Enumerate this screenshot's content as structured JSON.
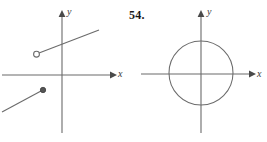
{
  "figure": {
    "exercise_number": "54.",
    "width": 267,
    "height": 142,
    "background_color": "#ffffff",
    "stroke_color": "#6b6b6b",
    "text_color": "#3a3a3a"
  },
  "left_graph": {
    "name": "piecewise-linear-graph",
    "origin": {
      "x": 62,
      "y": 75
    },
    "x_axis": {
      "label": "x",
      "start_x": 2,
      "end_x": 116,
      "y": 75,
      "arrow": "right"
    },
    "y_axis": {
      "label": "y",
      "x": 62,
      "start_y": 11,
      "end_y": 133,
      "arrow": "up"
    },
    "segments": [
      {
        "name": "upper-ray",
        "from": {
          "x": 37,
          "y": 54
        },
        "to": {
          "x": 99,
          "y": 30
        },
        "endpoint_style": "open-circle",
        "endpoint": {
          "x": 37,
          "y": 54
        }
      },
      {
        "name": "lower-ray",
        "from": {
          "x": 2,
          "y": 112
        },
        "to": {
          "x": 43,
          "y": 90
        },
        "endpoint_style": "filled-circle",
        "endpoint": {
          "x": 43,
          "y": 90
        }
      }
    ]
  },
  "right_graph": {
    "name": "circle-graph",
    "origin": {
      "x": 201,
      "y": 74
    },
    "x_axis": {
      "label": "x",
      "start_x": 141,
      "end_x": 255,
      "y": 74,
      "arrow": "right"
    },
    "y_axis": {
      "label": "y",
      "x": 201,
      "start_y": 11,
      "end_y": 133,
      "arrow": "up"
    },
    "circle": {
      "center": {
        "x": 201,
        "y": 73
      },
      "radius": 32
    }
  }
}
